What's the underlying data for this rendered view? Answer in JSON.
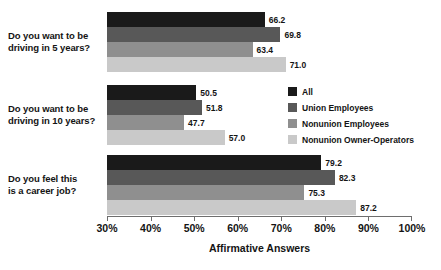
{
  "chart_data": {
    "type": "bar",
    "orientation": "horizontal",
    "title": "",
    "xlabel": "Affirmative Answers",
    "ylabel": "",
    "xlim": [
      30,
      100
    ],
    "xticks": [
      "30%",
      "40%",
      "50%",
      "60%",
      "70%",
      "80%",
      "90%",
      "100%"
    ],
    "xtick_values": [
      30,
      40,
      50,
      60,
      70,
      80,
      90,
      100
    ],
    "grid": false,
    "legend_position": "middle-right",
    "categories": [
      "Do you want to be driving in 5 years?",
      "Do you want to be driving in 10 years?",
      "Do you feel this is a career job?"
    ],
    "category_lines": [
      [
        "Do you want to be",
        "driving in 5 years?"
      ],
      [
        "Do you want to be",
        "driving in 10 years?"
      ],
      [
        "Do you feel this",
        "is a career job?"
      ]
    ],
    "series": [
      {
        "name": "All",
        "color": "#1a1a1a",
        "values": [
          66.2,
          50.5,
          79.2
        ],
        "labels": [
          "66.2",
          "50.5",
          "79.2"
        ]
      },
      {
        "name": "Union Employees",
        "color": "#585858",
        "values": [
          69.8,
          51.8,
          82.3
        ],
        "labels": [
          "69.8",
          "51.8",
          "82.3"
        ]
      },
      {
        "name": "Nonunion Employees",
        "color": "#8f8f8f",
        "values": [
          63.4,
          47.7,
          75.3
        ],
        "labels": [
          "63.4",
          "47.7",
          "75.3"
        ]
      },
      {
        "name": "Nonunion Owner-Operators",
        "color": "#c9c9c9",
        "values": [
          71.0,
          57.0,
          87.2
        ],
        "labels": [
          "71.0",
          "57.0",
          "87.2"
        ]
      }
    ]
  },
  "legend": {
    "items": [
      {
        "label": "All",
        "color": "#1a1a1a"
      },
      {
        "label": "Union Employees",
        "color": "#585858"
      },
      {
        "label": "Nonunion Employees",
        "color": "#8f8f8f"
      },
      {
        "label": "Nonunion Owner-Operators",
        "color": "#c9c9c9"
      }
    ]
  },
  "axis": {
    "title": "Affirmative Answers",
    "ticks": [
      "30%",
      "40%",
      "50%",
      "60%",
      "70%",
      "80%",
      "90%",
      "100%"
    ]
  }
}
